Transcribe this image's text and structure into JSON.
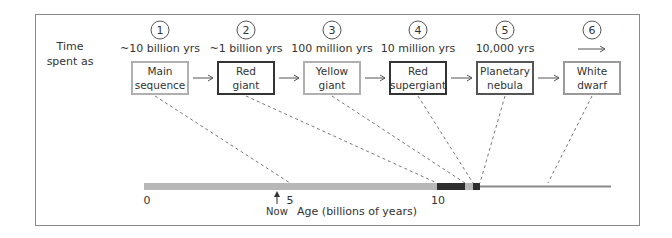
{
  "diagram": {
    "row_label_line1": "Time",
    "row_label_line2": "spent as",
    "stages": [
      {
        "num": "1",
        "time": "~10 billion yrs",
        "line1": "Main",
        "line2": "sequence",
        "border": "#b0b0b0",
        "bw": 2
      },
      {
        "num": "2",
        "time": "~1 billion yrs",
        "line1": "Red",
        "line2": "giant",
        "border": "#333333",
        "bw": 2
      },
      {
        "num": "3",
        "time": "100 million yrs",
        "line1": "Yellow",
        "line2": "giant",
        "border": "#b0b0b0",
        "bw": 2
      },
      {
        "num": "4",
        "time": "10 million yrs",
        "line1": "Red",
        "line2": "supergiant",
        "border": "#333333",
        "bw": 2
      },
      {
        "num": "5",
        "time": "10,000 yrs",
        "line1": "Planetary",
        "line2": "nebula",
        "border": "#555555",
        "bw": 2
      },
      {
        "num": "6",
        "time": "→",
        "line1": "White",
        "line2": "dwarf",
        "border": "#9a9a9a",
        "bw": 2
      }
    ],
    "axis": {
      "ticks": [
        "0",
        "5",
        "10"
      ],
      "now_label": "Now",
      "xlabel": "Age (billions of years)"
    }
  },
  "colors": {
    "light_bar": "#b8b8b8",
    "dark_bar": "#2e2e2e",
    "line": "#8a8a8a",
    "dash": "#777777"
  }
}
